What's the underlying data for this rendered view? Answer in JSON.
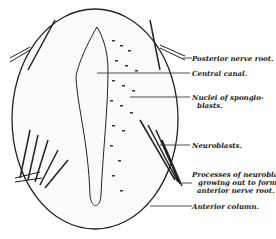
{
  "figure": {
    "labels": [
      {
        "id": "posterior-nerve-root",
        "text": "Posterior nerve root."
      },
      {
        "id": "central-canal",
        "text": "Central canal."
      },
      {
        "id": "nuclei-spongioblasts",
        "line1": "Nuclei of spongio-",
        "line2": "blasts."
      },
      {
        "id": "neuroblasts",
        "text": "Neuroblasts."
      },
      {
        "id": "processes-neuroblasts",
        "line1": "Processes of neuroblasts",
        "line2": "growing out to form",
        "line3": "anterior nerve root."
      },
      {
        "id": "anterior-column",
        "text": "Anterior column."
      }
    ]
  },
  "colors": {
    "ink": "#222222",
    "background": "#ffffff"
  }
}
